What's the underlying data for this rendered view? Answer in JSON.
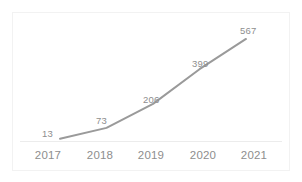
{
  "chart_data": {
    "type": "line",
    "title": "",
    "subtitle": "",
    "xlabel": "",
    "ylabel": "",
    "categories": [
      "2017",
      "2018",
      "2019",
      "2020",
      "2021"
    ],
    "values": [
      13,
      73,
      206,
      399,
      567
    ],
    "data_labels": [
      "13",
      "73",
      "206",
      "399",
      "567"
    ],
    "series": [
      {
        "name": "",
        "values": [
          13,
          73,
          206,
          399,
          567
        ]
      }
    ],
    "xlim": [
      2017,
      2021
    ],
    "ylim": [
      0,
      600
    ],
    "grid": false,
    "legend": false,
    "legend_position": "none",
    "markers": false,
    "colors": {
      "line": "#9a9a9a",
      "data_label_text": "#8e8e8e",
      "tick_label_text": "#8e8e8e",
      "axis_line": "#ececec",
      "frame_border": "#f2f2f2",
      "background": "#ffffff"
    }
  },
  "axis": {
    "x_ticks": [
      {
        "label": "2017"
      },
      {
        "label": "2018"
      },
      {
        "label": "2019"
      },
      {
        "label": "2020"
      },
      {
        "label": "2021"
      }
    ]
  },
  "points": [
    {
      "label": "13",
      "value": 13
    },
    {
      "label": "73",
      "value": 73
    },
    {
      "label": "206",
      "value": 206
    },
    {
      "label": "399",
      "value": 399
    },
    {
      "label": "567",
      "value": 567
    }
  ]
}
